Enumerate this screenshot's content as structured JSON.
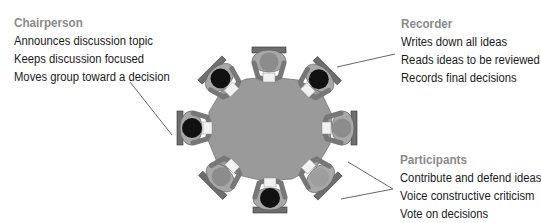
{
  "roles": [
    {
      "title": "Chairperson",
      "duties": [
        "Announces discussion topic",
        "Keeps discussion focused",
        "Moves group toward a decision"
      ]
    },
    {
      "title": "Recorder",
      "duties": [
        "Writes down all ideas",
        "Reads ideas to be reviewed",
        "Records final decisions"
      ]
    },
    {
      "title": "Participants",
      "duties": [
        "Contribute and defend ideas",
        "Voice constructive criticism",
        "Vote on decisions"
      ]
    }
  ],
  "diagram": {
    "seats": 8,
    "colors": {
      "table": "#9a9a9a",
      "chair": "#6e6e6e",
      "body": "#a8a8a8",
      "head_dark": "#111111",
      "head_light": "#8c8c8c",
      "leader_line": "#555555"
    }
  }
}
